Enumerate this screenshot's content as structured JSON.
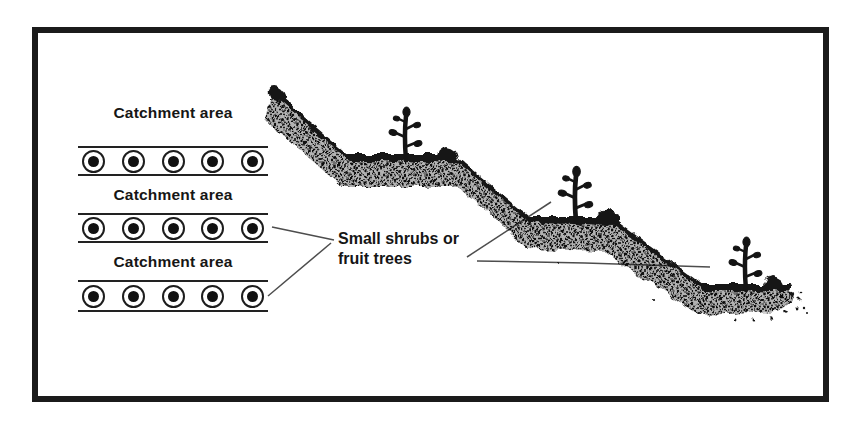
{
  "figure": {
    "type": "slope-terracing-diagram",
    "background": "#ffffff",
    "frame_color": "#1b1b1b",
    "ink_color": "#161616",
    "leader_line_color": "#4d4d4d"
  },
  "catchment": {
    "groups": [
      {
        "label": "Catchment area",
        "plants": 5
      },
      {
        "label": "Catchment area",
        "plants": 5
      },
      {
        "label": "Catchment area",
        "plants": 5
      }
    ]
  },
  "annotation": {
    "line1": "Small shrubs or",
    "line2": "fruit trees"
  },
  "slope": {
    "terrace_count": 3,
    "shrub_count": 3,
    "stone_count": 3
  }
}
